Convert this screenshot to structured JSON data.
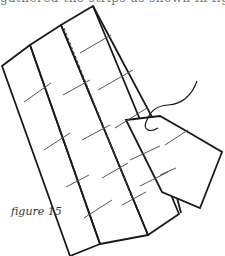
{
  "page": {
    "top_text_fragment": "gathered the strips as shown in figure, together",
    "caption": "figure 15"
  },
  "diagram": {
    "stroke_color": "#1a1a1a",
    "seam_color": "#555555"
  }
}
